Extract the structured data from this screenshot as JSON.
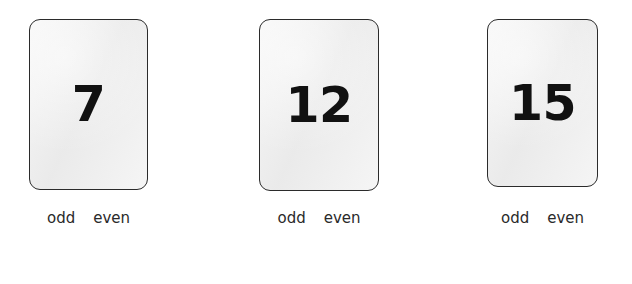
{
  "worksheet": {
    "background_color": "#ffffff",
    "card_fill_color": "#ededed",
    "card_border_color": "#2b2b2b",
    "number_color": "#111111",
    "label_color": "#2a2a2a",
    "cards": [
      {
        "number": "7",
        "choices": [
          {
            "label": "odd"
          },
          {
            "label": "even"
          }
        ]
      },
      {
        "number": "12",
        "choices": [
          {
            "label": "odd"
          },
          {
            "label": "even"
          }
        ]
      },
      {
        "number": "15",
        "choices": [
          {
            "label": "odd"
          },
          {
            "label": "even"
          }
        ]
      }
    ]
  }
}
